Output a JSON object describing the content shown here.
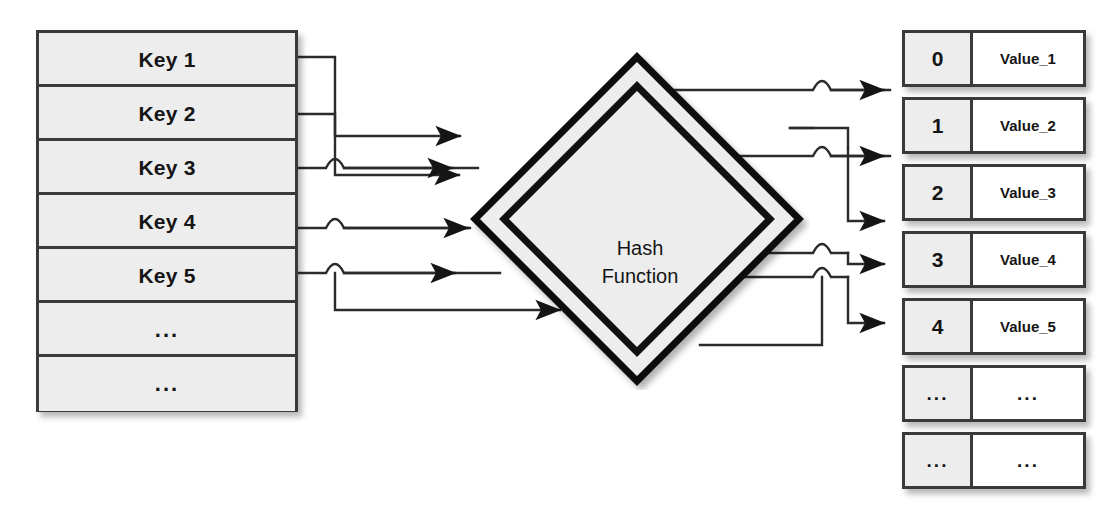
{
  "diagram": {
    "colors": {
      "line": "#2b2b2b",
      "box_border": "#3a3a3a",
      "cell_fill": "#ededed",
      "value_fill": "#ffffff",
      "text": "#151515",
      "background": "#ffffff"
    }
  },
  "keys_table": {
    "name": "keys-column",
    "rows": [
      {
        "label": "Key 1"
      },
      {
        "label": "Key 2"
      },
      {
        "label": "Key 3"
      },
      {
        "label": "Key 4"
      },
      {
        "label": "Key 5"
      },
      {
        "label": "..."
      },
      {
        "label": "..."
      }
    ]
  },
  "hash_function": {
    "line1": "Hash",
    "line2": "Function",
    "shape": "diamond"
  },
  "values_table": {
    "name": "values-column",
    "rows": [
      {
        "index": "0",
        "value": "Value_1"
      },
      {
        "index": "1",
        "value": "Value_2"
      },
      {
        "index": "2",
        "value": "Value_3"
      },
      {
        "index": "3",
        "value": "Value_4"
      },
      {
        "index": "4",
        "value": "Value_5"
      },
      {
        "index": "...",
        "value": "..."
      },
      {
        "index": "...",
        "value": "..."
      }
    ]
  },
  "connections": {
    "input_count": 5,
    "output_count": 5,
    "style": "orthogonal-with-hop-crossings",
    "arrowhead": "solid-triangle"
  }
}
